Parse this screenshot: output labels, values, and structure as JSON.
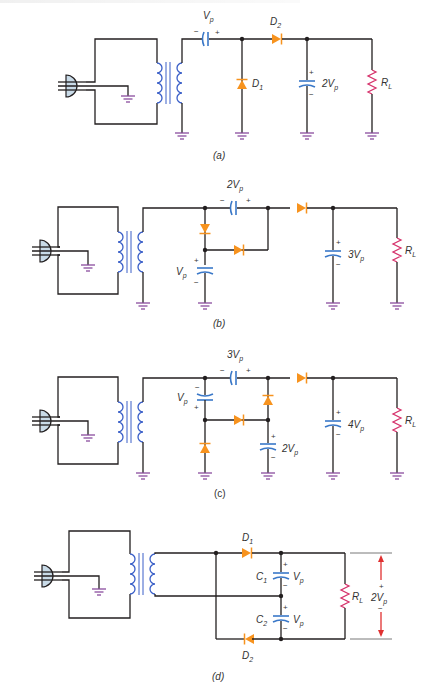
{
  "figure": {
    "colors": {
      "wire": "#231f20",
      "capacitor": "#3a78c8",
      "diode": "#f7931e",
      "resistor": "#d6336c",
      "ground": "#8a4c9e",
      "transformer": "#3a5fc8",
      "plug_fill": "#c9dbe8",
      "arrow": "#e03030"
    },
    "panels": [
      {
        "id": "a",
        "caption": "(a)",
        "title": "Voltage doubler (half-wave)",
        "labels": {
          "series_cap_voltage": "V",
          "series_cap_sub": "p",
          "d1": "D",
          "d1_sub": "1",
          "d2": "D",
          "d2_sub": "2",
          "out_cap_voltage": "2V",
          "out_cap_sub": "p",
          "load": "R",
          "load_sub": "L",
          "plus": "+",
          "minus": "−"
        }
      },
      {
        "id": "b",
        "caption": "(b)",
        "title": "Voltage tripler",
        "labels": {
          "series_cap_voltage": "2V",
          "series_cap_sub": "p",
          "shunt_cap_voltage": "V",
          "shunt_cap_sub": "p",
          "out_cap_voltage": "3V",
          "out_cap_sub": "p",
          "load": "R",
          "load_sub": "L",
          "plus": "+",
          "minus": "−"
        }
      },
      {
        "id": "c",
        "caption": "(c)",
        "title": "Voltage quadrupler",
        "labels": {
          "series_cap_voltage": "3V",
          "series_cap_sub": "p",
          "shunt_cap_voltage": "V",
          "shunt_cap_sub": "p",
          "mid_cap_voltage": "2V",
          "mid_cap_sub": "p",
          "out_cap_voltage": "4V",
          "out_cap_sub": "p",
          "load": "R",
          "load_sub": "L",
          "plus": "+",
          "minus": "−"
        }
      },
      {
        "id": "d",
        "caption": "(d)",
        "title": "Full-wave voltage doubler",
        "labels": {
          "d1": "D",
          "d1_sub": "1",
          "d2": "D",
          "d2_sub": "2",
          "c1": "C",
          "c1_sub": "1",
          "c2": "C",
          "c2_sub": "2",
          "c1_voltage": "V",
          "c1_voltage_sub": "p",
          "c2_voltage": "V",
          "c2_voltage_sub": "p",
          "load": "R",
          "load_sub": "L",
          "output_voltage": "2V",
          "output_voltage_sub": "p",
          "plus": "+",
          "minus": "−"
        }
      }
    ]
  }
}
